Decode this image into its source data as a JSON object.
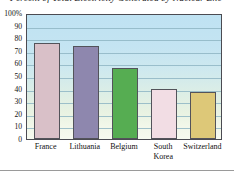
{
  "chart_data": {
    "type": "bar",
    "title_visible_fragment": "Percent of Total Electricity Generated by Nuclear Ene",
    "xlabel": "",
    "ylabel": "",
    "categories": [
      "France",
      "Lithuania",
      "Belgium",
      "South Korea",
      "Switzerland"
    ],
    "category_label_lines": [
      [
        "France"
      ],
      [
        "Lithuania"
      ],
      [
        "Belgium"
      ],
      [
        "South",
        "Korea"
      ],
      [
        "Switzerland"
      ]
    ],
    "values": [
      76,
      73.5,
      56,
      40,
      37.5
    ],
    "ylim": [
      0,
      100
    ],
    "ytick_values": [
      0,
      10,
      20,
      30,
      40,
      50,
      60,
      70,
      80,
      90,
      100
    ],
    "ytick_labels": [
      "0",
      "10",
      "20",
      "30",
      "40",
      "50",
      "60",
      "70",
      "80",
      "90",
      "100%"
    ],
    "grid": true,
    "grid_axis": "y",
    "legend": false,
    "legend_position": "none",
    "bar_colors": [
      "#d9c0c8",
      "#8e87ae",
      "#56ad52",
      "#f2dde4",
      "#ddc878"
    ],
    "bar_edge_color": "#53535a",
    "gridline_color": "#8fb6c4",
    "plot_border_color": "#4b4b52",
    "plot_background_top": "#bfe2f2",
    "plot_background_bottom": "#f7faf0",
    "axis_text_color": "#111111"
  }
}
